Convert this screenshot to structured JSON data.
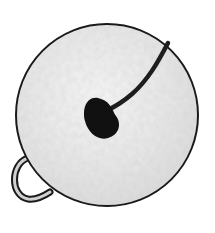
{
  "image": {
    "subject": "jingle bell",
    "description": "Hand-drawn illustration of a round jingle bell with a slot and a side loop",
    "colors": {
      "background": "#ffffff",
      "bell_fill": "#e6e6e6",
      "bell_highlight": "#f4f4f4",
      "outline": "#1a1a1a",
      "slot": "#111111",
      "loop_inner": "#d0d0d0"
    }
  }
}
